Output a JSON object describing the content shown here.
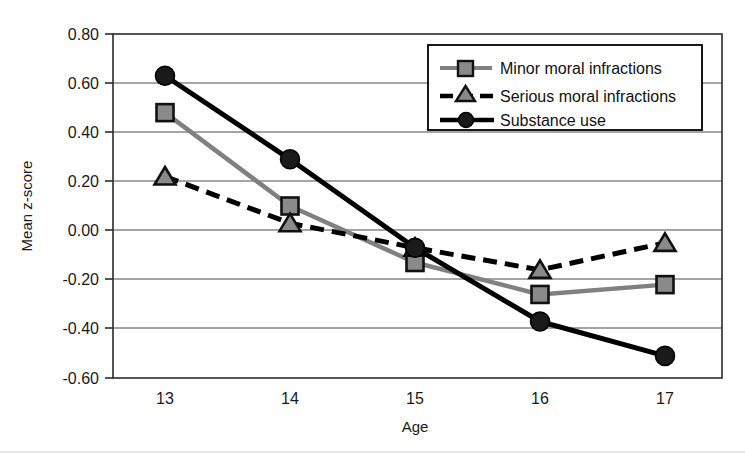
{
  "chart_data": {
    "type": "line",
    "title": "",
    "xlabel": "Age",
    "ylabel": "Mean z-score",
    "categories": [
      "13",
      "14",
      "15",
      "16",
      "17"
    ],
    "x": [
      13,
      14,
      15,
      16,
      17
    ],
    "xlim": [
      12.6,
      17.6
    ],
    "ylim": [
      -0.6,
      0.8
    ],
    "ytick_labels": [
      "0.80",
      "0.60",
      "0.40",
      "0.20",
      "0.00",
      "-0.20",
      "-0.40",
      "-0.60"
    ],
    "ytick_values": [
      0.8,
      0.6,
      0.4,
      0.2,
      0.0,
      -0.2,
      -0.4,
      -0.6
    ],
    "grid": true,
    "legend_position": "top-right",
    "series": [
      {
        "name": "Minor moral infractions",
        "values": [
          0.48,
          0.1,
          -0.13,
          -0.26,
          -0.22
        ],
        "color": "#808080",
        "marker": "square",
        "linestyle": "solid"
      },
      {
        "name": "Serious moral infractions",
        "values": [
          0.22,
          0.03,
          -0.07,
          -0.16,
          -0.05
        ],
        "color": "#000000",
        "marker": "triangle",
        "linestyle": "dashed"
      },
      {
        "name": "Substance use",
        "values": [
          0.63,
          0.29,
          -0.07,
          -0.37,
          -0.51
        ],
        "color": "#000000",
        "marker": "circle",
        "linestyle": "solid"
      }
    ]
  },
  "axes": {
    "y_title": "Mean z-score",
    "x_title": "Age",
    "ytick_0": "0.80",
    "ytick_1": "0.60",
    "ytick_2": "0.40",
    "ytick_3": "0.20",
    "ytick_4": "0.00",
    "ytick_5": "-0.20",
    "ytick_6": "-0.40",
    "ytick_7": "-0.60",
    "xtick_0": "13",
    "xtick_1": "14",
    "xtick_2": "15",
    "xtick_3": "16",
    "xtick_4": "17"
  },
  "legend": {
    "entry_0": "Minor moral infractions",
    "entry_1": "Serious moral infractions",
    "entry_2": "Substance use"
  }
}
